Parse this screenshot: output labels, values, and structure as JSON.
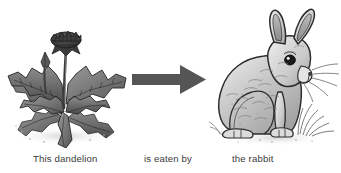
{
  "page": {
    "background_color": "#ffffff",
    "width": 341,
    "height": 173
  },
  "diagram": {
    "type": "food-chain",
    "direction": "left-to-right",
    "text_color": "#3a3a3a",
    "nodes": [
      {
        "id": "producer",
        "icon": "dandelion-illustration",
        "label": "This dandelion",
        "style": "grayscale pen-and-ink botanical drawing",
        "description": "Dandelion plant with a dark flower head on a tall thin stem, a small side bud, and deeply lobed toothed leaves radiating outward from the base"
      },
      {
        "id": "consumer",
        "icon": "rabbit-illustration",
        "label": "the rabbit",
        "style": "grayscale pen-and-ink animal drawing",
        "description": "Rabbit sitting upright facing right with two long erect ears, a dark round eye, whiskers and stippled fur, with grass tufts at its feet"
      }
    ],
    "connector": {
      "id": "eats-arrow",
      "icon": "right-arrow-icon",
      "label": "is eaten by",
      "color": "#555555",
      "shape": "solid block arrow pointing right"
    }
  },
  "captions": {
    "subject": "This dandelion",
    "relation": "is eaten by",
    "object": "the rabbit"
  },
  "colors": {
    "background": "#ffffff",
    "arrow": "#555555",
    "ink_dark": "#2e2e2e",
    "ink_mid": "#6f6f6f",
    "ink_light": "#b4b4b4",
    "text": "#3a3a3a"
  }
}
